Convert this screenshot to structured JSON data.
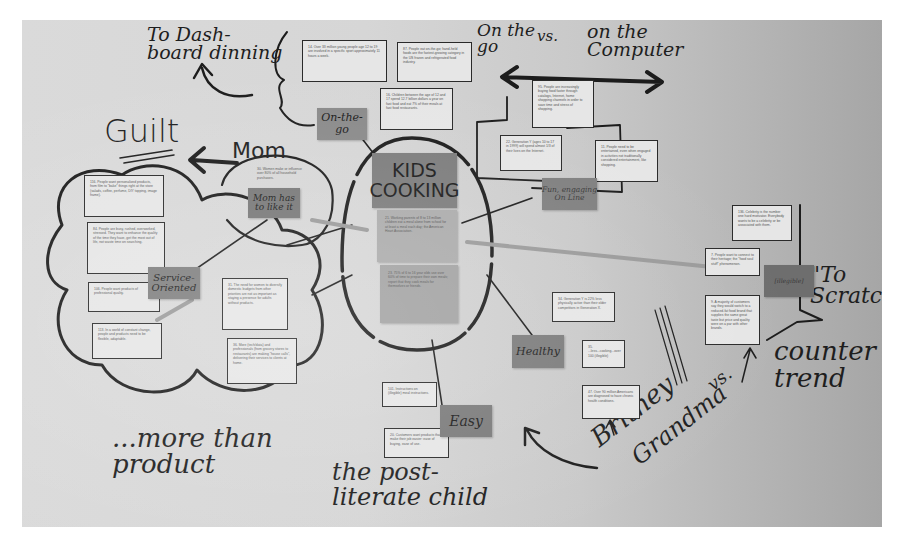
{
  "photo": {
    "description": "Whiteboard affinity diagram photo",
    "central_theme": "KIDS COOKING"
  },
  "handwriting": {
    "dashboard": "To Dash-\nboard dinning",
    "on_the_go_vs": "On the\ngo",
    "vs": "vs.",
    "on_the_computer": "on the\nComputer",
    "guilt": "Guilt",
    "mom": "Mom",
    "more_than_product": "...more than\nproduct",
    "post_literate": "the post-\nliterate child",
    "britney": "Britney",
    "vs2": "vs.",
    "grandma": "Grandma",
    "to_scratch": "\"To\nScratch\"",
    "counter_trend": "counter\ntrend"
  },
  "stickies": {
    "kids_cooking": "KIDS\nCOOKING",
    "on_the_go": "On-the-\ngo",
    "mom_has_to_like": "Mom has\nto like it",
    "service_oriented": "Service-\nOriented",
    "fun_engaging": "Fun, engaging\nOn Line",
    "healthy": "Healthy",
    "easy": "Easy",
    "whole_meal": "[illegible]"
  },
  "cards": [
    {
      "id": "c14",
      "text": "14. Over 33 million young people age 12 to 19 are involved in a specific sport approximately 11 hours a week."
    },
    {
      "id": "c87",
      "text": "87. People eat on-the-go; hand-held foods are the fastest-growing category in the US frozen and refrigerated food industry."
    },
    {
      "id": "c16",
      "text": "16. Children between the age of 12 and 17 spend 12.7 billion dollars a year on fast food and eat 7% of their meals at fast food restaurants."
    },
    {
      "id": "c95",
      "text": "95. People are increasingly buying food faster through catalogs, Internet, home shopping channels in order to save time and stress of shopping."
    },
    {
      "id": "c22",
      "text": "22. Generation Y (ages 10 to 17 in 1999) will spend almost 1/3 of their lives on the Internet."
    },
    {
      "id": "c11",
      "text": "11. People need to be entertained, even when engaged in activities not traditionally considered entertainment, like shopping."
    },
    {
      "id": "c30",
      "text": "30. Women make or influence over 80% of all household purchases."
    },
    {
      "id": "c116",
      "text": "116. People want personalized products, from film to \"bake\" things right at the store (salads, coffee, perfume, DIY topping, image frame)."
    },
    {
      "id": "c84",
      "text": "84. People are busy, rushed, overworked, stressed. They want to enhance the quality of the time they have, get the most out of life, not waste time on searching."
    },
    {
      "id": "c106",
      "text": "106. People want products of professional quality."
    },
    {
      "id": "c113",
      "text": "113. In a world of constant change, people and products need to be flexible, adaptable."
    },
    {
      "id": "c31",
      "text": "31. The need for women to diversify domestic budgets from other priorities are not as important as staying a presence for adults without products."
    },
    {
      "id": "c36",
      "text": "36. More (tech/data) and professionals (from grocery stores to restaurants) are making \"house calls\", delivering their services to clients at home."
    },
    {
      "id": "c21",
      "text": "21. Working parents of 8 to 13 million children eat a meal alone from school for at least a meal each day; the American Heart Association."
    },
    {
      "id": "c23",
      "text": "23. 75% of 6 to 16 year olds use over 60% of time to prepare their own meals; report that they cook meals for themselves or friends."
    },
    {
      "id": "c136",
      "text": "136. Celebrity is the number one hard motivator. Everybody wants to be a celebrity or be associated with them."
    },
    {
      "id": "c7",
      "text": "7. People want to connect to their heritage; the \"food soul stuff\" phenomenon."
    },
    {
      "id": "c9",
      "text": "9. A majority of customers say they would switch to a reduced-fat food brand that supplies the same great taste but price and quality were on a par with other brands."
    },
    {
      "id": "c34",
      "text": "34. Generation Y is 22% less physically active than their older competitors in Generation X."
    },
    {
      "id": "c35",
      "text": "35. ...less...cooking...over 100 (illegible)"
    },
    {
      "id": "c47",
      "text": "47. Over 90 million Americans are diagnosed to have chronic health conditions."
    },
    {
      "id": "c101",
      "text": "101. Instructions on (illegible) meal instructions."
    },
    {
      "id": "c20",
      "text": "20. Customers want products that make their job easier: ease of buying, ease of use."
    }
  ]
}
